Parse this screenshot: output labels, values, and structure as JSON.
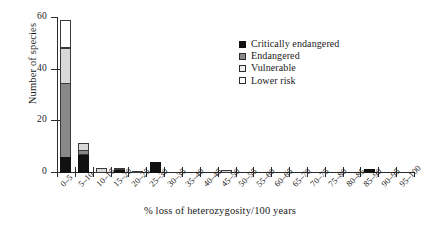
{
  "chart_data": {
    "type": "bar",
    "subtype": "stacked-bar-histogram",
    "title": "",
    "xlabel": "% loss of heterozygosity/100 years",
    "ylabel": "Number of species",
    "ylim": [
      0,
      60
    ],
    "yticks": [
      0,
      20,
      40,
      60
    ],
    "grid": false,
    "legend_position": "inside-top-right",
    "categories": [
      "0–5",
      "5–10",
      "10–15",
      "15–20",
      "20–25",
      "25–30",
      "30–35",
      "35–40",
      "40–45",
      "45–50",
      "50–55",
      "55–60",
      "60–65",
      "65–70",
      "70–75",
      "75–80",
      "80–85",
      "85–90",
      "90–95",
      "95–100"
    ],
    "series": [
      {
        "name": "Critically endangered",
        "color": "#111111",
        "values": [
          6,
          7,
          0,
          1.2,
          0,
          4,
          0,
          0,
          0,
          0,
          0,
          0,
          0,
          0,
          0,
          0,
          0,
          1.5,
          0,
          0
        ]
      },
      {
        "name": "Endangered",
        "color": "#888888",
        "values": [
          29,
          2,
          0,
          0,
          0,
          0,
          0,
          0,
          0,
          0,
          0,
          0,
          0,
          0,
          0,
          0,
          0,
          0,
          0,
          0
        ]
      },
      {
        "name": "Vulnerable",
        "color": "#d9d9d9",
        "values": [
          14,
          3,
          2,
          0.3,
          0.4,
          0,
          0,
          0,
          0,
          1,
          0,
          0,
          0,
          0,
          0,
          0,
          0,
          0,
          0,
          0
        ]
      },
      {
        "name": "Lower risk",
        "color": "#ffffff",
        "values": [
          11,
          0,
          0,
          0,
          0,
          0,
          0,
          0,
          0,
          0,
          0,
          0,
          0,
          0,
          0,
          0,
          0,
          0,
          0,
          0
        ]
      }
    ],
    "totals": [
      60,
      12,
      2,
      1.5,
      0.4,
      4,
      0,
      0,
      0,
      1,
      0,
      0,
      0,
      0,
      0,
      0,
      0,
      1.5,
      0,
      0
    ]
  },
  "axes": {
    "y": {
      "label": "Number of species",
      "ticks": [
        {
          "value": 60,
          "text": "60"
        },
        {
          "value": 40,
          "text": "40"
        },
        {
          "value": 20,
          "text": "20"
        },
        {
          "value": 0,
          "text": "0"
        }
      ]
    },
    "x": {
      "label": "% loss of heterozygosity/100 years"
    }
  },
  "legend": {
    "items": [
      {
        "label": "Critically endangered",
        "swatch": "black-square-icon"
      },
      {
        "label": "Endangered",
        "swatch": "dark-gray-square-icon"
      },
      {
        "label": "Vulnerable",
        "swatch": "light-gray-square-icon"
      },
      {
        "label": "Lower risk",
        "swatch": "white-square-icon"
      }
    ]
  }
}
